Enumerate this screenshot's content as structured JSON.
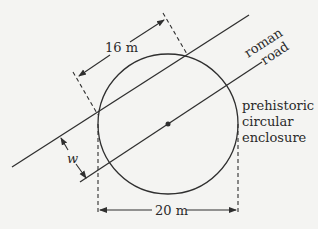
{
  "diagram": {
    "labels": {
      "road_line1": "roman",
      "road_line2": "road",
      "enclosure_line1": "prehistoric",
      "enclosure_line2": "circular",
      "enclosure_line3": "enclosure",
      "chord_length": "16 m",
      "diameter": "20 m",
      "road_width": "w"
    },
    "colors": {
      "line": "#2f2f2f",
      "background": "#f4f4f2"
    }
  }
}
